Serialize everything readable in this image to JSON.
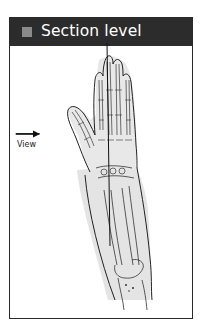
{
  "header": {
    "title": "Section level",
    "marker_color": "#8a8a8a",
    "background_color": "#2c2c2c"
  },
  "diagram": {
    "annotation_label": "View",
    "annotation_arrow": "right-arrow",
    "section_line": "vertical-line-through-middle-finger"
  }
}
